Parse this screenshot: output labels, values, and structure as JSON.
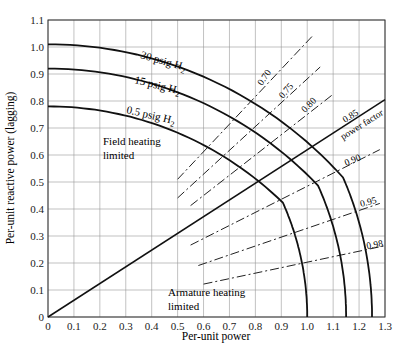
{
  "chart_data": {
    "type": "line",
    "title": "",
    "xlabel": "Per-unit power",
    "ylabel": "Per-unit reactive power (lagging)",
    "xlim": [
      0,
      1.3
    ],
    "ylim": [
      0,
      1.1
    ],
    "xticks": [
      "0",
      "0.1",
      "0.2",
      "0.3",
      "0.4",
      "0.5",
      "0.6",
      "0.7",
      "0.8",
      "0.9",
      "1.0",
      "1.1",
      "1.2",
      "1.3"
    ],
    "yticks": [
      "0",
      "0.1",
      "0.2",
      "0.3",
      "0.4",
      "0.5",
      "0.6",
      "0.7",
      "0.8",
      "0.9",
      "1.0",
      "1.1"
    ],
    "grid": true,
    "series": [
      {
        "name": "30 psig H2",
        "style": "solid",
        "field_limit": {
          "center_q": -0.55,
          "radius": 1.56,
          "x_range": [
            0,
            1.07
          ]
        },
        "armature_limit": {
          "radius": 1.25,
          "x_end": 1.25
        },
        "points": [
          [
            0,
            1.01
          ],
          [
            0.3,
            0.98
          ],
          [
            0.6,
            0.88
          ],
          [
            0.9,
            0.74
          ],
          [
            1.07,
            0.65
          ],
          [
            1.15,
            0.52
          ],
          [
            1.22,
            0.3
          ],
          [
            1.25,
            0
          ]
        ]
      },
      {
        "name": "15 psig H2",
        "style": "solid",
        "field_limit": {
          "center_q": -0.55,
          "radius": 1.47,
          "x_range": [
            0,
            0.94
          ]
        },
        "armature_limit": {
          "radius": 1.15,
          "x_end": 1.15
        },
        "points": [
          [
            0,
            0.92
          ],
          [
            0.3,
            0.89
          ],
          [
            0.6,
            0.79
          ],
          [
            0.94,
            0.6
          ],
          [
            1.05,
            0.45
          ],
          [
            1.12,
            0.27
          ],
          [
            1.15,
            0
          ]
        ]
      },
      {
        "name": "0.5 psig H2",
        "style": "solid",
        "field_limit": {
          "center_q": -0.55,
          "radius": 1.33,
          "x_range": [
            0,
            0.85
          ]
        },
        "armature_limit": {
          "radius": 1.0,
          "x_end": 1.0
        },
        "points": [
          [
            0,
            0.785
          ],
          [
            0.3,
            0.75
          ],
          [
            0.6,
            0.65
          ],
          [
            0.85,
            0.52
          ],
          [
            0.93,
            0.37
          ],
          [
            0.98,
            0.2
          ],
          [
            1.0,
            0
          ]
        ]
      },
      {
        "name": "0.85 power factor",
        "style": "solid",
        "points": [
          [
            0,
            0
          ],
          [
            1.3,
            0.805
          ]
        ]
      }
    ],
    "pf_lines": [
      {
        "label": "0.70",
        "pf": 0.7,
        "x_range": [
          0.5,
          1.02
        ]
      },
      {
        "label": "0.75",
        "pf": 0.75,
        "x_range": [
          0.5,
          1.05
        ]
      },
      {
        "label": "0.80",
        "pf": 0.8,
        "x_range": [
          0.55,
          1.1
        ]
      },
      {
        "label": "0.90",
        "pf": 0.9,
        "x_range": [
          0.55,
          1.28
        ]
      },
      {
        "label": "0.95",
        "pf": 0.95,
        "x_range": [
          0.58,
          1.28
        ]
      },
      {
        "label": "0.98",
        "pf": 0.98,
        "x_range": [
          0.6,
          1.3
        ]
      }
    ],
    "annotations": [
      {
        "text": "30 psig H₂",
        "x": 0.55,
        "y": 0.97
      },
      {
        "text": "15 psig H₂",
        "x": 0.5,
        "y": 0.88
      },
      {
        "text": "0.5 psig H₂",
        "x": 0.45,
        "y": 0.76
      },
      {
        "text": "Field heating",
        "x": 0.4,
        "y": 0.65
      },
      {
        "text": "limited",
        "x": 0.4,
        "y": 0.61
      },
      {
        "text": "Armature heating",
        "x": 0.6,
        "y": 0.09
      },
      {
        "text": "limited",
        "x": 0.6,
        "y": 0.05
      },
      {
        "text": "power factor",
        "x": 1.18,
        "y": 0.7
      }
    ]
  },
  "labels": {
    "xlabel": "Per-unit power",
    "ylabel": "Per-unit reactive power (lagging)",
    "curve_30": "30 psig H",
    "curve_15": "15 psig H",
    "curve_05": "0.5 psig H",
    "sub2": "2",
    "field1": "Field heating",
    "field2": "limited",
    "arm1": "Armature heating",
    "arm2": "limited",
    "pf085": "0.85",
    "pf_text": "power factor",
    "pf070": "0.70",
    "pf075": "0.75",
    "pf080": "0.80",
    "pf090": "0.90",
    "pf095": "0.95",
    "pf098": "0.98",
    "caption": "Figure 5.xx"
  }
}
